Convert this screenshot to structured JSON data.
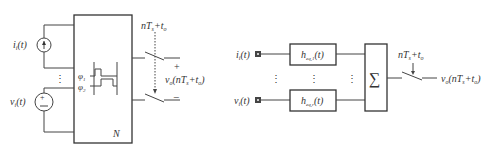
{
  "left_circuit": {
    "current_source_label": "i",
    "current_source_sub": "i",
    "current_source_arg": "(t)",
    "voltage_source_label": "v",
    "voltage_source_sub": "i",
    "voltage_source_arg": "(t)",
    "network_label": "N",
    "phase1": "φ",
    "phase1_sub": "1",
    "phase2": "φ",
    "phase2_sub": "2",
    "sample_time": "nT",
    "sample_time_sub": "s",
    "sample_time_plus": "+t",
    "sample_time_plus_sub": "o",
    "output_plus": "+",
    "output_minus": "−",
    "output_label": "v",
    "output_sub": "o",
    "output_arg_a": "(nT",
    "output_arg_sub": "s",
    "output_arg_b": "+t",
    "output_arg_sub2": "o",
    "output_arg_c": ")",
    "ellipsis": "⋮"
  },
  "right_model": {
    "input1_label": "i",
    "input1_sub": "i",
    "input1_arg": "(t)",
    "input2_label": "v",
    "input2_sub": "i",
    "input2_arg": "(t)",
    "filter1": "h",
    "filter1_sub": "eq,1",
    "filter1_arg": "(t)",
    "filter2": "h",
    "filter2_sub": "eq,r",
    "filter2_arg": "(t)",
    "summer": "∑",
    "sample_time": "nT",
    "sample_time_sub": "s",
    "sample_time_plus": "+t",
    "sample_time_plus_sub": "o",
    "output_label": "v",
    "output_sub": "o",
    "output_arg_a": "(nT",
    "output_arg_sub": "s",
    "output_arg_b": "+t",
    "output_arg_sub2": "o",
    "output_arg_c": ")",
    "ellipsis": "⋮"
  }
}
